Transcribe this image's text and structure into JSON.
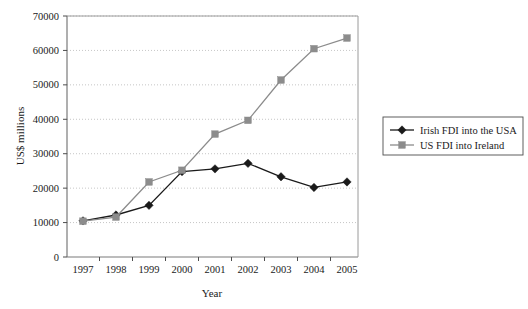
{
  "chart_data": {
    "type": "line",
    "title": "",
    "xlabel": "Year",
    "ylabel": "US$ millions",
    "categories": [
      "1997",
      "1998",
      "1999",
      "2000",
      "2001",
      "2002",
      "2003",
      "2004",
      "2005"
    ],
    "x": [
      1997,
      1998,
      1999,
      2000,
      2001,
      2002,
      2003,
      2004,
      2005
    ],
    "series": [
      {
        "name": "Irish FDI into the USA",
        "marker": "diamond",
        "color": "#1a1a1a",
        "values": [
          10500,
          12200,
          15000,
          24800,
          25600,
          27200,
          23300,
          20200,
          21800
        ]
      },
      {
        "name": "US FDI into Ireland",
        "marker": "square",
        "color": "#8c8c8c",
        "values": [
          10400,
          11600,
          21800,
          25200,
          35700,
          39700,
          51400,
          60500,
          63600
        ]
      }
    ],
    "ylim": [
      0,
      70000
    ],
    "yticks": [
      0,
      10000,
      20000,
      30000,
      40000,
      50000,
      60000,
      70000
    ],
    "ytick_labels": [
      "0",
      "10000",
      "20000",
      "30000",
      "40000",
      "50000",
      "60000",
      "70000"
    ],
    "grid": "horizontal-dotted",
    "legend_position": "right"
  },
  "legend": {
    "items": [
      {
        "label": "Irish FDI into the USA",
        "marker": "diamond",
        "color": "#1a1a1a"
      },
      {
        "label": "US FDI into Ireland",
        "marker": "square",
        "color": "#8c8c8c"
      }
    ]
  }
}
